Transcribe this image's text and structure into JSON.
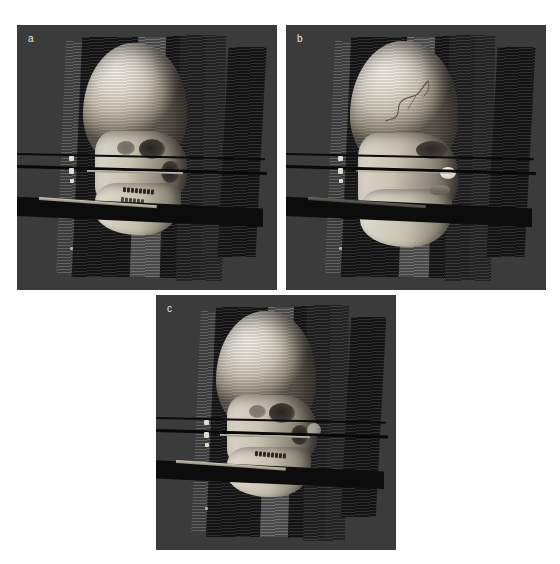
{
  "figure": {
    "background_color": "#ffffff",
    "panel_background_color": "#3b3b3b",
    "label_color": "#e8e8e8",
    "width": 560,
    "height": 564
  },
  "panels": [
    {
      "id": "a",
      "label": "a",
      "name": "panel-a-bone-rendering",
      "description": "Volume rendering with bone/skull preset, lateral oblique view with sagittal slab stack and three edge-on axial planes",
      "x": 17,
      "y": 25,
      "width": 260,
      "height": 265,
      "label_x": 11,
      "label_y": 9,
      "render_mode": "bone",
      "visible_structures": [
        "cranial vault",
        "orbital rim",
        "zygomatic arch",
        "maxilla with dentition",
        "mandible",
        "nasal aperture"
      ]
    },
    {
      "id": "b",
      "label": "b",
      "name": "panel-b-soft-tissue-rendering",
      "description": "Volume rendering with skin/soft-tissue preset showing facial profile, nose and lips, with a superficial vascular tracing on the scalp",
      "x": 286,
      "y": 25,
      "width": 260,
      "height": 265,
      "label_x": 11,
      "label_y": 9,
      "render_mode": "soft-tissue",
      "visible_structures": [
        "scalp surface",
        "superficial vessel tracing",
        "orbit / eyelid",
        "nasal tip",
        "lips",
        "chin"
      ]
    },
    {
      "id": "c",
      "label": "c",
      "name": "panel-c-fused-rendering",
      "description": "Fused bone and soft-tissue volume rendering, same oblique lateral orientation with identical cut planes",
      "x": 156,
      "y": 295,
      "width": 240,
      "height": 255,
      "label_x": 11,
      "label_y": 9,
      "render_mode": "fused",
      "visible_structures": [
        "cranial vault",
        "semi-transparent skin envelope",
        "maxillary dentition",
        "mandible",
        "orbital region"
      ]
    }
  ],
  "annotations": {
    "cut_planes": [
      {
        "name": "axial-plane-upper",
        "orientation": "axial",
        "appearance": "thin dark line seen nearly edge-on"
      },
      {
        "name": "axial-plane-middle",
        "orientation": "axial",
        "appearance": "thin dark line seen nearly edge-on"
      },
      {
        "name": "axial-plane-lower",
        "orientation": "axial",
        "appearance": "wide dark wedge seen edge-on with bright leading edge"
      }
    ],
    "slab_stack": {
      "name": "sagittal-slab-stack",
      "count": 5,
      "appearance": "vertical striped plates of alternating brightness flanking the head"
    },
    "fiducials": {
      "name": "fiducial-markers",
      "count": 4,
      "appearance": "small bright ticks on the left slab edge"
    }
  }
}
